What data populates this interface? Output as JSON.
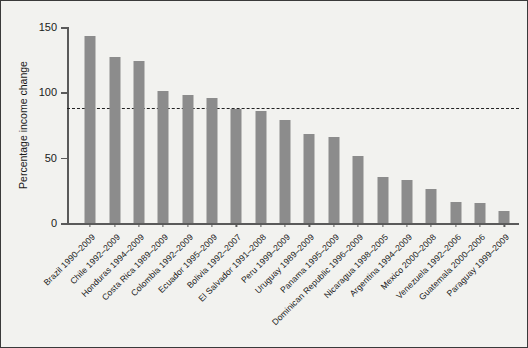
{
  "chart_data": {
    "type": "bar",
    "title": "",
    "xlabel": "",
    "ylabel": "Percentage income change",
    "ylim": [
      0,
      150
    ],
    "yticks": [
      0,
      50,
      100,
      150
    ],
    "ytick_labels": [
      "0",
      "50",
      "100",
      "150"
    ],
    "grid": false,
    "legend": "none",
    "bar_color": "#8c8c8c",
    "background_color": "#f2f2ef",
    "axis_color": "#5a5a5a",
    "border_color": "#3a3a3a",
    "reference_line": {
      "value": 88,
      "style": "dashed",
      "color": "#222222",
      "label": ""
    },
    "categories": [
      "Brazil 1990–2009",
      "Chile 1992–2009",
      "Honduras 1994–2009",
      "Costa Rica 1989–2009",
      "Colombia 1992–2009",
      "Ecuador 1995–2009",
      "Bolivia 1992–2007",
      "El Salvador 1991–2008",
      "Peru 1999–2009",
      "Uruguay 1989–2009",
      "Panama 1995–2009",
      "Dominican Republic 1996–2009",
      "Nicaragua 1998–2005",
      "Argentina 1994–2009",
      "Mexico 2000–2008",
      "Venezuela 1992–2006",
      "Guatemala 2000–2006",
      "Paraguay 1999–2009"
    ],
    "values": [
      143,
      127,
      124,
      101,
      98,
      96,
      87,
      86,
      79,
      68,
      66,
      51,
      35,
      33,
      26,
      16,
      15,
      9
    ]
  }
}
